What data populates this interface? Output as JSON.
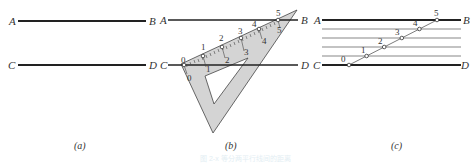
{
  "figure": {
    "colors": {
      "line": "#222222",
      "set_square_fill": "#d4d4d4",
      "set_square_edge": "#444444"
    },
    "panels": [
      {
        "id": "a",
        "caption": "(a)",
        "lines": [
          {
            "left_label": "A",
            "right_label": "B"
          },
          {
            "left_label": "C",
            "right_label": "D"
          }
        ]
      },
      {
        "id": "b",
        "caption": "(b)",
        "lines": [
          {
            "left_label": "A",
            "right_label": "B"
          },
          {
            "left_label": "C",
            "right_label": "D"
          }
        ],
        "ruler_marks": [
          "0",
          "1",
          "2",
          "3",
          "4",
          "5"
        ],
        "ruler_inner_marks": [
          "0",
          "1",
          "2",
          "3",
          "4",
          "5"
        ]
      },
      {
        "id": "c",
        "caption": "(c)",
        "lines": [
          {
            "left_label": "A",
            "right_label": "B"
          },
          {
            "left_label": "C",
            "right_label": "D"
          }
        ],
        "division_points": [
          "0",
          "1",
          "2",
          "3",
          "4",
          "5"
        ],
        "equal_parts": 5
      }
    ],
    "faint_caption": "图 2-x 等分两平行线间的距离"
  }
}
